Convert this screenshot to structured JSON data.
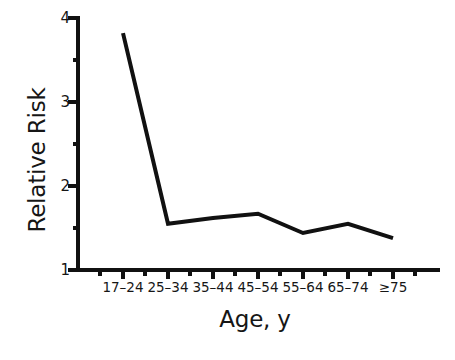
{
  "chart_data": {
    "type": "line",
    "title": "",
    "xlabel": "Age, y",
    "ylabel": "Relative Risk",
    "categories": [
      "17–24",
      "25–34",
      "35–44",
      "45–54",
      "55–64",
      "65–74",
      "≥75"
    ],
    "values": [
      3.82,
      1.55,
      1.62,
      1.67,
      1.44,
      1.55,
      1.38
    ],
    "series": [
      {
        "name": "Relative Risk",
        "values": [
          3.82,
          1.55,
          1.62,
          1.67,
          1.44,
          1.55,
          1.38
        ]
      }
    ],
    "ylim": [
      1,
      4
    ],
    "xlim": [
      0,
      8
    ],
    "y_ticks": [
      1,
      2,
      3,
      4
    ],
    "y_tick_labels": [
      "1",
      "2",
      "3",
      "4"
    ],
    "y_minor_ticks": [
      1.5,
      2.5,
      3.5
    ],
    "grid": false,
    "legend": null,
    "line_color": "#111111",
    "line_width": 4,
    "axis_color": "#111111",
    "background": "#ffffff"
  },
  "axes": {
    "y_title": "Relative Risk",
    "x_title": "Age, y",
    "y_labels": [
      "4",
      "3",
      "2",
      "1"
    ],
    "x_labels": [
      "17–24",
      "25–34",
      "35–44",
      "45–54",
      "55–64",
      "65–74",
      "≥75"
    ]
  }
}
